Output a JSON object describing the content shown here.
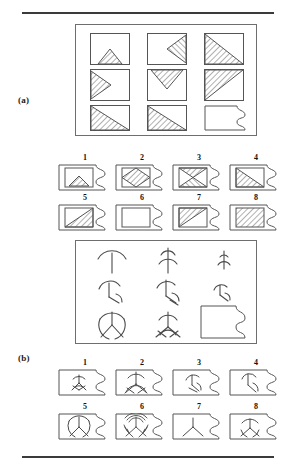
{
  "figure": {
    "type": "progressive-matrices-test",
    "panels": [
      {
        "id": "a",
        "label": "(a)",
        "matrix": {
          "rows": 3,
          "cols": 3,
          "cells": [
            {
              "row": 1,
              "col": 1,
              "shape": "triangle-up-small-bottom",
              "hatch": "diag-up",
              "desc": "small hatched triangle pointing up, sitting on bottom edge"
            },
            {
              "row": 1,
              "col": 2,
              "shape": "triangle-left-medium-right",
              "hatch": "diag-up",
              "desc": "medium hatched triangle pointing left, attached to right edge"
            },
            {
              "row": 1,
              "col": 3,
              "shape": "triangle-lower-left-large",
              "hatch": "diag-up",
              "desc": "large hatched triangle occupying lower-left half"
            },
            {
              "row": 2,
              "col": 1,
              "shape": "triangle-right-medium-left",
              "hatch": "diag-up",
              "desc": "medium hatched triangle pointing right, attached to left edge"
            },
            {
              "row": 2,
              "col": 2,
              "shape": "triangle-down-medium-top",
              "hatch": "diag-up",
              "desc": "medium hatched triangle pointing down, attached to top edge"
            },
            {
              "row": 2,
              "col": 3,
              "shape": "triangle-upper-left-large",
              "hatch": "diag-up",
              "desc": "large hatched triangle occupying upper-left half"
            },
            {
              "row": 3,
              "col": 1,
              "shape": "triangle-lower-left-full",
              "hatch": "diag-up",
              "desc": "full hatched triangle lower-left half of square"
            },
            {
              "row": 3,
              "col": 2,
              "shape": "triangle-lower-left-full",
              "hatch": "diag-up",
              "desc": "full hatched triangle lower-left half of square"
            },
            {
              "row": 3,
              "col": 3,
              "shape": "missing-piece",
              "hatch": "none",
              "desc": "blank puzzle-piece cell (answer to be filled in)"
            }
          ]
        },
        "options": [
          {
            "number": "1",
            "shape": "triangle-up-small-bottom",
            "hatch": "diag-up"
          },
          {
            "number": "2",
            "shape": "diamond",
            "hatch": "diag-up"
          },
          {
            "number": "3",
            "shape": "bowtie-horizontal",
            "hatch": "diag-mixed"
          },
          {
            "number": "4",
            "shape": "triangle-lower-left-full",
            "hatch": "diag-up"
          },
          {
            "number": "5",
            "shape": "triangle-lower-left-full",
            "hatch": "diag-up"
          },
          {
            "number": "6",
            "shape": "empty-square",
            "hatch": "none"
          },
          {
            "number": "7",
            "shape": "triangle-upper-left-full",
            "hatch": "diag-up"
          },
          {
            "number": "8",
            "shape": "filled-square",
            "hatch": "diag-up"
          }
        ]
      },
      {
        "id": "b",
        "label": "(b)",
        "matrix": {
          "rows": 3,
          "cols": 3,
          "cells": [
            {
              "row": 1,
              "col": 1,
              "shape": "spokes-1-arc-top",
              "desc": "single vertical stem with one wide arc at top"
            },
            {
              "row": 1,
              "col": 2,
              "shape": "spokes-2-arc-top",
              "desc": "vertical stem with two small arcs at top"
            },
            {
              "row": 1,
              "col": 3,
              "shape": "spokes-3-arc-small",
              "desc": "short stem with small arcs at top"
            },
            {
              "row": 2,
              "col": 1,
              "shape": "spokes-2-branch",
              "desc": "stem with one arc at top and one branch lower right"
            },
            {
              "row": 2,
              "col": 2,
              "shape": "spokes-2-branch-double",
              "desc": "stem with arc at top plus two lower branches"
            },
            {
              "row": 2,
              "col": 3,
              "shape": "spokes-2-branch-small",
              "desc": "small stem with arc and lower branches"
            },
            {
              "row": 3,
              "col": 1,
              "shape": "tri-spoke-circle",
              "desc": "three spokes from center joined by circular arcs"
            },
            {
              "row": 3,
              "col": 2,
              "shape": "tri-spoke-arcs",
              "desc": "three spokes from center with arcs on each"
            },
            {
              "row": 3,
              "col": 3,
              "shape": "missing-piece",
              "desc": "blank puzzle-piece cell (answer to be filled in)"
            }
          ]
        },
        "options": [
          {
            "number": "1",
            "shape": "tri-spoke-small-arcs"
          },
          {
            "number": "2",
            "shape": "tri-spoke-large-arcs"
          },
          {
            "number": "3",
            "shape": "spokes-2-branch"
          },
          {
            "number": "4",
            "shape": "spokes-2-branch-alt"
          },
          {
            "number": "5",
            "shape": "tri-spoke-circle"
          },
          {
            "number": "6",
            "shape": "tri-spoke-many-arcs"
          },
          {
            "number": "7",
            "shape": "tri-spoke-plain"
          },
          {
            "number": "8",
            "shape": "tri-spoke-circle-wide"
          }
        ]
      }
    ]
  },
  "colors": {
    "rule": "#3a3a3a",
    "outline": "#555555",
    "hatch": "#6f6f6f",
    "background": "#ffffff",
    "text": "#111111"
  }
}
